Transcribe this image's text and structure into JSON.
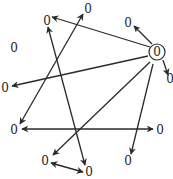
{
  "diagram": {
    "type": "directed-graph",
    "colors": {
      "edge": "#2a2a2a",
      "label": "#222222",
      "background": "#ffffff"
    },
    "nodes": [
      {
        "id": "n1",
        "label": "0",
        "x": 88,
        "y": 10
      },
      {
        "id": "n2",
        "label": "0",
        "x": 47,
        "y": 22
      },
      {
        "id": "n3",
        "label": "0",
        "x": 128,
        "y": 24
      },
      {
        "id": "n4",
        "label": "0",
        "x": 14,
        "y": 49
      },
      {
        "id": "hub",
        "label": "0",
        "x": 157,
        "y": 53,
        "ring": true
      },
      {
        "id": "n6",
        "label": "0",
        "x": 170,
        "y": 80
      },
      {
        "id": "n7",
        "label": "0",
        "x": 5,
        "y": 89
      },
      {
        "id": "n8",
        "label": "0",
        "x": 14,
        "y": 131
      },
      {
        "id": "n9",
        "label": "0",
        "x": 160,
        "y": 131
      },
      {
        "id": "n10",
        "label": "0",
        "x": 128,
        "y": 162
      },
      {
        "id": "n11",
        "label": "0",
        "x": 45,
        "y": 162
      },
      {
        "id": "n12",
        "label": "0",
        "x": 89,
        "y": 173
      }
    ],
    "edges": [
      {
        "from": "hub",
        "to": "n2",
        "x1": 150,
        "y1": 47,
        "x2": 52,
        "y2": 17
      },
      {
        "from": "hub",
        "to": "n3",
        "x1": 152,
        "y1": 44,
        "x2": 134,
        "y2": 26
      },
      {
        "from": "hub",
        "to": "n6",
        "x1": 163,
        "y1": 60,
        "x2": 168,
        "y2": 75
      },
      {
        "from": "hub",
        "to": "n7",
        "x1": 148,
        "y1": 56,
        "x2": 12,
        "y2": 86
      },
      {
        "from": "hub",
        "to": "n11",
        "x1": 150,
        "y1": 62,
        "x2": 53,
        "y2": 155
      },
      {
        "from": "hub",
        "to": "n10",
        "x1": 153,
        "y1": 64,
        "x2": 131,
        "y2": 154
      },
      {
        "from": "n8",
        "to": "n1",
        "x1": 20,
        "y1": 124,
        "x2": 83,
        "y2": 14
      },
      {
        "from": "n1",
        "to": "n8",
        "x1": 83,
        "y1": 14,
        "x2": 20,
        "y2": 124
      },
      {
        "from": "n12",
        "to": "n2",
        "x1": 85,
        "y1": 165,
        "x2": 48,
        "y2": 27
      },
      {
        "from": "n2",
        "to": "n12",
        "x1": 48,
        "y1": 27,
        "x2": 85,
        "y2": 165
      },
      {
        "from": "n9",
        "to": "n8",
        "x1": 153,
        "y1": 129,
        "x2": 22,
        "y2": 129
      },
      {
        "from": "n8",
        "to": "n9",
        "x1": 22,
        "y1": 129,
        "x2": 153,
        "y2": 129
      },
      {
        "from": "n11",
        "to": "n12",
        "x1": 51,
        "y1": 163,
        "x2": 83,
        "y2": 172
      },
      {
        "from": "n12",
        "to": "n11",
        "x1": 83,
        "y1": 172,
        "x2": 51,
        "y2": 163
      }
    ]
  }
}
